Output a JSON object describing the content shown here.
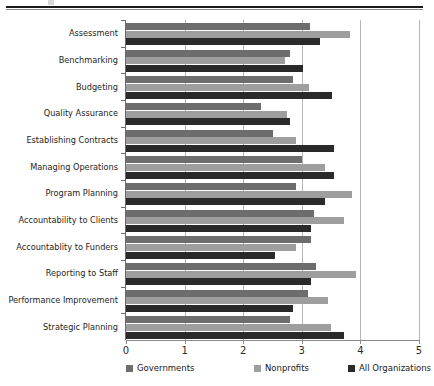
{
  "chart_data": {
    "type": "bar",
    "orientation": "horizontal",
    "title": "",
    "subtitle": "",
    "xlabel": "",
    "ylabel": "",
    "xlim": [
      0,
      5
    ],
    "xticks": [
      "0",
      "1",
      "2",
      "3",
      "4",
      "5"
    ],
    "grid": true,
    "legend_position": "bottom",
    "categories": [
      "Assessment",
      "Benchmarking",
      "Budgeting",
      "Quality Assurance",
      "Establishing Contracts",
      "Managing Operations",
      "Program Planning",
      "Accountability to Clients",
      "Accountablity to Funders",
      "Reporting to Staff",
      "Performance Improvement",
      "Strategic Planning"
    ],
    "series": [
      {
        "name": "Governments",
        "color": "#6d6d6d",
        "values": [
          3.14,
          2.8,
          2.85,
          2.3,
          2.5,
          3.0,
          2.9,
          3.2,
          3.15,
          3.25,
          3.1,
          2.8
        ]
      },
      {
        "name": "Nonprofits",
        "color": "#9e9e9e",
        "values": [
          3.82,
          2.72,
          3.12,
          2.75,
          2.9,
          3.4,
          3.85,
          3.72,
          2.9,
          3.92,
          3.45,
          3.5
        ]
      },
      {
        "name": "All Organizations",
        "color": "#2a2a2a",
        "values": [
          3.31,
          3.02,
          3.52,
          2.8,
          3.55,
          3.55,
          3.4,
          3.15,
          2.55,
          3.15,
          2.85,
          3.72
        ]
      }
    ]
  },
  "legend": {
    "items": [
      {
        "label": "Governments",
        "color": "#6d6d6d"
      },
      {
        "label": "Nonprofits",
        "color": "#9e9e9e"
      },
      {
        "label": "All Organizations",
        "color": "#2a2a2a"
      }
    ]
  }
}
